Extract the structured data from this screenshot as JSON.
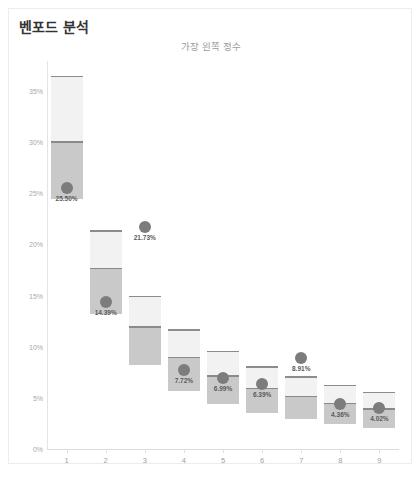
{
  "card": {
    "title": "벤포드 분석",
    "subtitle": "가장 왼쪽 정수"
  },
  "chart_data": {
    "type": "bar",
    "title": "벤포드 분석",
    "subtitle": "가장 왼쪽 정수",
    "xlabel": "",
    "ylabel": "",
    "ylim": [
      0,
      38
    ],
    "yticks": [
      0,
      5,
      10,
      15,
      20,
      25,
      30,
      35
    ],
    "ytick_labels": [
      "0%",
      "5%",
      "10%",
      "15%",
      "20%",
      "25%",
      "30%",
      "35%"
    ],
    "categories": [
      "1",
      "2",
      "3",
      "4",
      "5",
      "6",
      "7",
      "8",
      "9"
    ],
    "grid": false,
    "legend": "none",
    "series": [
      {
        "name": "실제 비율",
        "type": "scatter",
        "values": [
          25.5,
          14.39,
          21.73,
          7.72,
          6.99,
          6.39,
          8.91,
          4.36,
          4.02
        ],
        "labels": [
          "25.50%",
          "14.39%",
          "21.73%",
          "7.72%",
          "6.99%",
          "6.39%",
          "8.91%",
          "4.36%",
          "4.02%"
        ]
      },
      {
        "name": "기대 범위 (외곽)",
        "type": "range",
        "upper": [
          36.5,
          21.4,
          15.0,
          11.7,
          9.6,
          8.1,
          7.1,
          6.3,
          5.6
        ],
        "lower": [
          24.4,
          13.2,
          8.2,
          5.7,
          4.4,
          3.5,
          2.9,
          2.4,
          2.1
        ]
      },
      {
        "name": "기대 범위 (내곽)",
        "type": "range",
        "upper": [
          30.1,
          17.7,
          12.0,
          9.0,
          7.2,
          6.0,
          5.2,
          4.5,
          4.0
        ],
        "lower": [
          24.4,
          13.2,
          8.2,
          5.7,
          4.4,
          3.5,
          2.9,
          2.4,
          2.1
        ]
      }
    ],
    "colors": {
      "outer_band": "#f2f2f2",
      "inner_band": "#c9c9c9",
      "cap_line": "#8c8c8c",
      "dot": "#7c7c7c",
      "axis": "#e0e0e0",
      "tick_text": "#a8a8a8",
      "title_text": "#333333",
      "subtitle_text": "#9a9a9a"
    }
  }
}
